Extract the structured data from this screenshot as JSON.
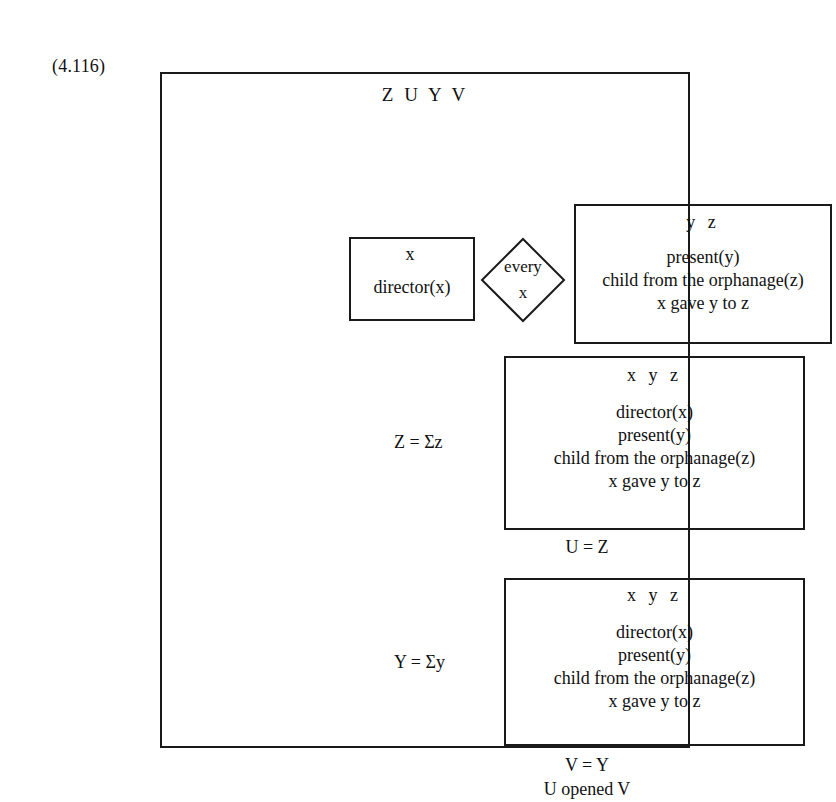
{
  "equation_label": "(4.116)",
  "outer_drs": {
    "universe": "Z U Y V"
  },
  "top_row": {
    "left_drs": {
      "universe": "x",
      "conditions": [
        "director(x)"
      ]
    },
    "quantifier_diamond": {
      "line1": "every",
      "line2": "x"
    },
    "right_drs": {
      "universe": "y  z",
      "conditions": [
        "present(y)",
        "child from the orphanage(z)",
        "x gave y to z"
      ]
    }
  },
  "middle_row": {
    "label": "Z = Σz",
    "drs": {
      "universe": "x  y  z",
      "conditions": [
        "director(x)",
        "present(y)",
        "child from the orphanage(z)",
        "x gave y to z"
      ]
    }
  },
  "equation_u": "U = Z",
  "bottom_row": {
    "label": "Y = Σy",
    "drs": {
      "universe": "x  y  z",
      "conditions": [
        "director(x)",
        "present(y)",
        "child from the orphanage(z)",
        "x gave y to z"
      ]
    }
  },
  "bottom_conditions": [
    "V = Y",
    "U opened V"
  ],
  "colors": {
    "ink": "#1a1a1a",
    "paper": "#ffffff"
  }
}
